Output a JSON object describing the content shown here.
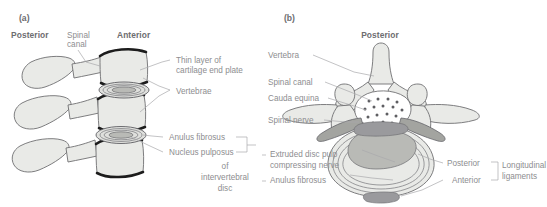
{
  "figure": {
    "background_color": "#ffffff",
    "label_color": "#8d8d8f",
    "heading_color": "#6d6d70",
    "bone_fill": "#e9eae7",
    "outline_color": "#6f6f72",
    "dark_endplate_color": "#1c1c1c"
  },
  "panel_a": {
    "tag": "(a)",
    "view": "lateral",
    "headings": {
      "posterior": "Posterior",
      "anterior": "Anterior"
    },
    "labels": {
      "spinal_canal_line1": "Spinal",
      "spinal_canal_line2": "canal",
      "cartilage_line1": "Thin layer of",
      "cartilage_line2": "cartilage end plate",
      "vertebrae": "Vertebrae",
      "anulus_fibrosus": "Anulus fibrosus",
      "nucleus_pulposus": "Nucleus pulposus",
      "bracket_line1": "of",
      "bracket_line2": "intervertebral",
      "bracket_line3": "disc"
    }
  },
  "panel_b": {
    "tag": "(b)",
    "view": "axial cross-section",
    "headings": {
      "posterior": "Posterior"
    },
    "labels": {
      "vertebra": "Vertebra",
      "spinal_canal": "Spinal canal",
      "cauda_equina": "Cauda equina",
      "spinal_nerve": "Spinal nerve",
      "extruded_line1": "Extruded disc pulp",
      "extruded_line2": "compressing nerve",
      "anulus_fibrosus": "Anulus fibrosus",
      "posterior": "Posterior",
      "anterior": "Anterior",
      "ligaments_line1": "Longitudinal",
      "ligaments_line2": "ligaments"
    }
  }
}
